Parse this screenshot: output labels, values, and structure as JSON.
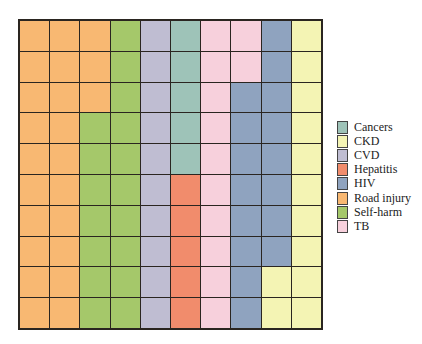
{
  "chart_data": {
    "type": "waffle",
    "title": "",
    "grid": {
      "rows": 10,
      "cols": 10,
      "fill_order": "column-major, top-to-bottom, left-to-right"
    },
    "categories": [
      "Road injury",
      "Self-harm",
      "CVD",
      "Cancers",
      "Hepatitis",
      "TB",
      "HIV",
      "CKD"
    ],
    "values": [
      23,
      17,
      10,
      5,
      5,
      12,
      16,
      12
    ],
    "colors": {
      "Cancers": "#9ec3b8",
      "CKD": "#f4f4b4",
      "CVD": "#bfbdd2",
      "Hepatitis": "#f18c6c",
      "HIV": "#8fa3bf",
      "Road injury": "#f8b872",
      "Self-harm": "#a5c86a",
      "TB": "#f7d0dc"
    },
    "legend": {
      "position": "right",
      "entries": [
        "Cancers",
        "CKD",
        "CVD",
        "Hepatitis",
        "HIV",
        "Road injury",
        "Self-harm",
        "TB"
      ]
    }
  }
}
